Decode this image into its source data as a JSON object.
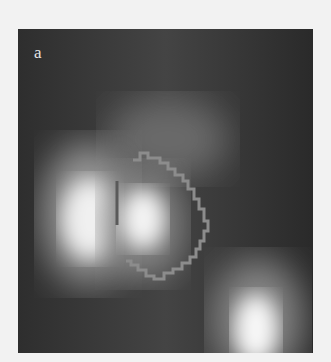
{
  "figure": {
    "panel_label": "a",
    "colors": {
      "background": "#f2f2f2",
      "image_base": "#3a3a3a",
      "roi_outline": "#8c8c8c"
    }
  }
}
